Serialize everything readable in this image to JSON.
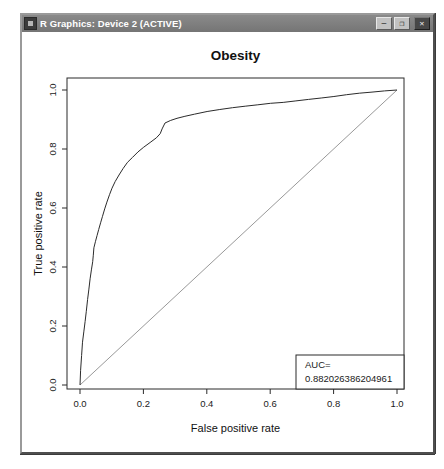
{
  "window": {
    "title": "R Graphics: Device 2 (ACTIVE)",
    "icon": "r-graphics-app-icon",
    "controls": {
      "minimize_glyph": "–",
      "maximize_glyph": "❐",
      "close_glyph": "✕"
    }
  },
  "chart_data": {
    "type": "line",
    "title": "Obesity",
    "xlabel": "False positive rate",
    "ylabel": "True positive rate",
    "xlim": [
      0.0,
      1.0
    ],
    "ylim": [
      0.0,
      1.0
    ],
    "xticks": [
      "0.0",
      "0.2",
      "0.4",
      "0.6",
      "0.8",
      "1.0"
    ],
    "yticks": [
      "0.0",
      "0.2",
      "0.4",
      "0.6",
      "0.8",
      "1.0"
    ],
    "grid": false,
    "box": true,
    "legend": {
      "position": "bottomright",
      "line1": "AUC=",
      "line2": "0.882026386204961"
    },
    "auc": 0.882026386204961,
    "series": [
      {
        "name": "ROC curve",
        "color": "#2b2b2b",
        "points": [
          [
            0,
            0
          ],
          [
            0.002,
            0.05
          ],
          [
            0.005,
            0.1
          ],
          [
            0.008,
            0.145
          ],
          [
            0.012,
            0.18
          ],
          [
            0.016,
            0.215
          ],
          [
            0.02,
            0.25
          ],
          [
            0.024,
            0.29
          ],
          [
            0.028,
            0.325
          ],
          [
            0.032,
            0.36
          ],
          [
            0.036,
            0.39
          ],
          [
            0.04,
            0.418
          ],
          [
            0.042,
            0.44
          ],
          [
            0.044,
            0.465
          ],
          [
            0.049,
            0.487
          ],
          [
            0.054,
            0.507
          ],
          [
            0.059,
            0.527
          ],
          [
            0.065,
            0.55
          ],
          [
            0.071,
            0.572
          ],
          [
            0.078,
            0.597
          ],
          [
            0.085,
            0.62
          ],
          [
            0.093,
            0.645
          ],
          [
            0.101,
            0.667
          ],
          [
            0.111,
            0.69
          ],
          [
            0.123,
            0.712
          ],
          [
            0.136,
            0.734
          ],
          [
            0.15,
            0.755
          ],
          [
            0.166,
            0.772
          ],
          [
            0.183,
            0.79
          ],
          [
            0.201,
            0.806
          ],
          [
            0.221,
            0.822
          ],
          [
            0.241,
            0.838
          ],
          [
            0.253,
            0.852
          ],
          [
            0.259,
            0.868
          ],
          [
            0.268,
            0.888
          ],
          [
            0.286,
            0.897
          ],
          [
            0.306,
            0.904
          ],
          [
            0.331,
            0.911
          ],
          [
            0.361,
            0.918
          ],
          [
            0.401,
            0.927
          ],
          [
            0.441,
            0.934
          ],
          [
            0.481,
            0.94
          ],
          [
            0.521,
            0.945
          ],
          [
            0.561,
            0.95
          ],
          [
            0.601,
            0.955
          ],
          [
            0.641,
            0.958
          ],
          [
            0.681,
            0.963
          ],
          [
            0.721,
            0.968
          ],
          [
            0.761,
            0.973
          ],
          [
            0.801,
            0.978
          ],
          [
            0.841,
            0.984
          ],
          [
            0.881,
            0.989
          ],
          [
            0.921,
            0.993
          ],
          [
            0.961,
            0.997
          ],
          [
            1,
            1
          ]
        ]
      },
      {
        "name": "reference diagonal",
        "color": "#999999",
        "points": [
          [
            0,
            0
          ],
          [
            1,
            1
          ]
        ]
      }
    ]
  },
  "colors": {
    "titlebar_bg": "#7d7d7d",
    "titlebar_text": "#ffffff",
    "canvas_bg": "#ffffff",
    "axis": "#2b2b2b",
    "curve": "#2b2b2b",
    "diagonal": "#999999"
  }
}
